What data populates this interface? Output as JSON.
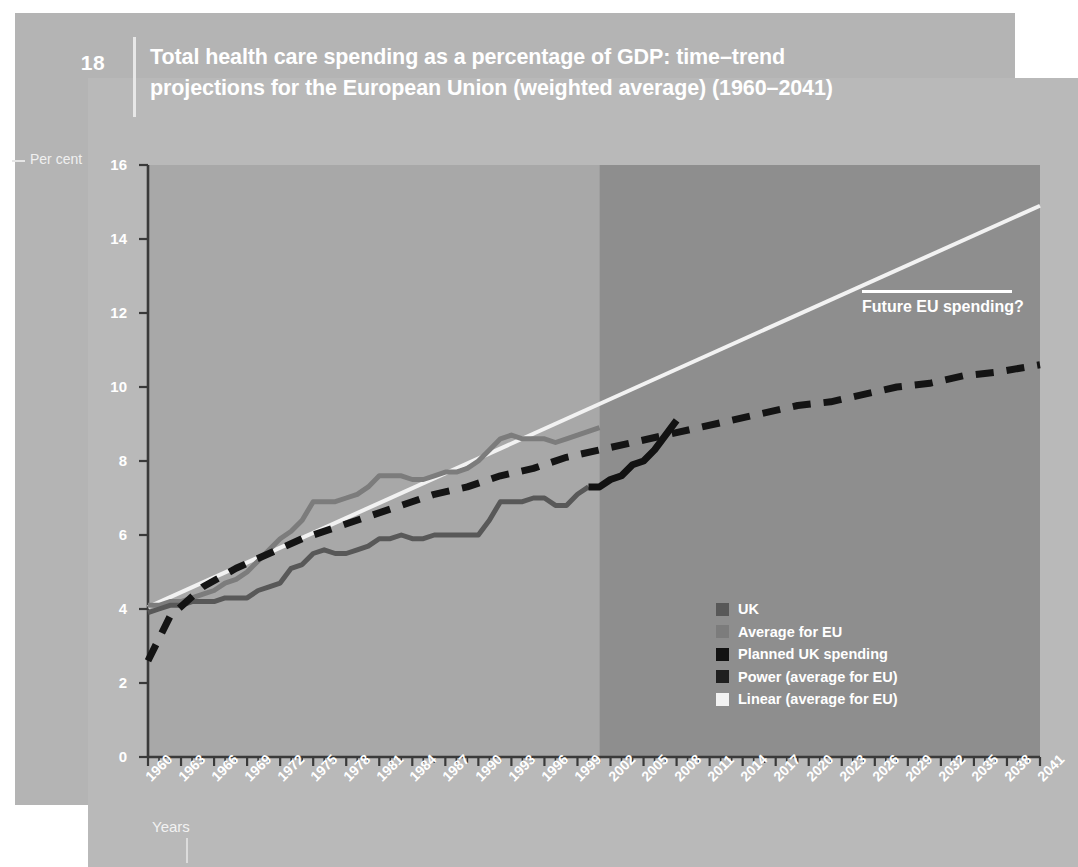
{
  "header": {
    "page_number": "18",
    "title_line1": "Total health care spending as a percentage of GDP: time–trend",
    "title_line2": "projections for the European Union (weighted average) (1960–2041)"
  },
  "colors": {
    "paper_back": "#b4b4b4",
    "paper_front": "#b9b9b9",
    "plot_history_bg": "#a8a8a8",
    "plot_projection_bg": "#8e8e8e",
    "uk_line": "#585858",
    "eu_line": "#7c7c7c",
    "planned_uk": "#121212",
    "power_trend": "#141414",
    "linear_trend": "#f2f2f2",
    "axis": "#3a3a3a",
    "text_white": "#ffffff"
  },
  "annotation": {
    "text": "Future EU spending?"
  },
  "axis_labels": {
    "y_title": "Per cent",
    "x_title": "Years"
  },
  "legend": {
    "position": "inside-bottom-right",
    "items": [
      {
        "label": "UK",
        "color": "#585858",
        "style": "solid"
      },
      {
        "label": "Average for EU",
        "color": "#7c7c7c",
        "style": "solid"
      },
      {
        "label": "Planned UK spending",
        "color": "#121212",
        "style": "solid"
      },
      {
        "label": "Power (average for EU)",
        "color": "#1f1f1f",
        "style": "dashed"
      },
      {
        "label": "Linear (average for EU)",
        "color": "#f2f2f2",
        "style": "solid"
      }
    ]
  },
  "chart_data": {
    "type": "line",
    "title": "Total health care spending as a percentage of GDP: time–trend projections for the European Union (weighted average) (1960–2041)",
    "xlabel": "Years",
    "ylabel": "Per cent",
    "xlim": [
      1960,
      2041
    ],
    "ylim": [
      0,
      16
    ],
    "ytick_values": [
      0,
      2,
      4,
      6,
      8,
      10,
      12,
      14,
      16
    ],
    "xtick_values": [
      1960,
      1963,
      1966,
      1969,
      1972,
      1975,
      1978,
      1981,
      1984,
      1987,
      1990,
      1993,
      1996,
      1999,
      2002,
      2005,
      2008,
      2011,
      2014,
      2017,
      2020,
      2023,
      2026,
      2029,
      2032,
      2035,
      2038,
      2041
    ],
    "xtick_labels": [
      "1960",
      "1963",
      "1966",
      "1969",
      "1972",
      "1975",
      "1978",
      "1981",
      "1984",
      "1987",
      "1990",
      "1993",
      "1996",
      "1999",
      "2002",
      "2005",
      "2008",
      "2011",
      "2014",
      "2017",
      "2020",
      "2023",
      "2026",
      "2029",
      "2032",
      "2035",
      "2038",
      "2041"
    ],
    "grid": false,
    "minor_ticks_every": 1,
    "projection_start_year": 2001,
    "series": [
      {
        "name": "UK",
        "color": "#585858",
        "style": "solid",
        "x": [
          1960,
          1961,
          1962,
          1963,
          1964,
          1965,
          1966,
          1967,
          1968,
          1969,
          1970,
          1971,
          1972,
          1973,
          1974,
          1975,
          1976,
          1977,
          1978,
          1979,
          1980,
          1981,
          1982,
          1983,
          1984,
          1985,
          1986,
          1987,
          1988,
          1989,
          1990,
          1991,
          1992,
          1993,
          1994,
          1995,
          1996,
          1997,
          1998,
          1999,
          2000
        ],
        "y": [
          3.9,
          4.0,
          4.1,
          4.1,
          4.2,
          4.2,
          4.2,
          4.3,
          4.3,
          4.3,
          4.5,
          4.6,
          4.7,
          5.1,
          5.2,
          5.5,
          5.6,
          5.5,
          5.5,
          5.6,
          5.7,
          5.9,
          5.9,
          6.0,
          5.9,
          5.9,
          6.0,
          6.0,
          6.0,
          6.0,
          6.0,
          6.4,
          6.9,
          6.9,
          6.9,
          7.0,
          7.0,
          6.8,
          6.8,
          7.1,
          7.3
        ]
      },
      {
        "name": "Average for EU",
        "color": "#7c7c7c",
        "style": "solid",
        "x": [
          1960,
          1961,
          1962,
          1963,
          1964,
          1965,
          1966,
          1967,
          1968,
          1969,
          1970,
          1971,
          1972,
          1973,
          1974,
          1975,
          1976,
          1977,
          1978,
          1979,
          1980,
          1981,
          1982,
          1983,
          1984,
          1985,
          1986,
          1987,
          1988,
          1989,
          1990,
          1991,
          1992,
          1993,
          1994,
          1995,
          1996,
          1997,
          1998,
          1999,
          2000,
          2001
        ],
        "y": [
          4.1,
          4.1,
          4.2,
          4.2,
          4.3,
          4.4,
          4.5,
          4.7,
          4.8,
          5.0,
          5.3,
          5.6,
          5.9,
          6.1,
          6.4,
          6.9,
          6.9,
          6.9,
          7.0,
          7.1,
          7.3,
          7.6,
          7.6,
          7.6,
          7.5,
          7.5,
          7.6,
          7.7,
          7.7,
          7.8,
          8.0,
          8.3,
          8.6,
          8.7,
          8.6,
          8.6,
          8.6,
          8.5,
          8.6,
          8.7,
          8.8,
          8.9
        ]
      },
      {
        "name": "Planned UK spending",
        "color": "#121212",
        "style": "solid",
        "x": [
          2000,
          2001,
          2002,
          2003,
          2004,
          2005,
          2006,
          2007,
          2008
        ],
        "y": [
          7.3,
          7.3,
          7.5,
          7.6,
          7.9,
          8.0,
          8.3,
          8.7,
          9.1
        ]
      },
      {
        "name": "Power (average for EU)",
        "color": "#141414",
        "style": "dashed",
        "x": [
          1960,
          1962,
          1965,
          1968,
          1971,
          1974,
          1977,
          1980,
          1983,
          1986,
          1989,
          1992,
          1995,
          1998,
          2001,
          2004,
          2007,
          2010,
          2013,
          2016,
          2019,
          2022,
          2025,
          2028,
          2031,
          2034,
          2037,
          2041
        ],
        "y": [
          2.6,
          3.8,
          4.6,
          5.1,
          5.5,
          5.9,
          6.2,
          6.5,
          6.8,
          7.1,
          7.3,
          7.6,
          7.8,
          8.1,
          8.3,
          8.5,
          8.7,
          8.9,
          9.1,
          9.3,
          9.5,
          9.6,
          9.8,
          10.0,
          10.1,
          10.3,
          10.4,
          10.6
        ]
      },
      {
        "name": "Linear (average for EU)",
        "color": "#f2f2f2",
        "style": "solid",
        "x": [
          1960,
          2041
        ],
        "y": [
          4.05,
          14.9
        ]
      }
    ]
  }
}
